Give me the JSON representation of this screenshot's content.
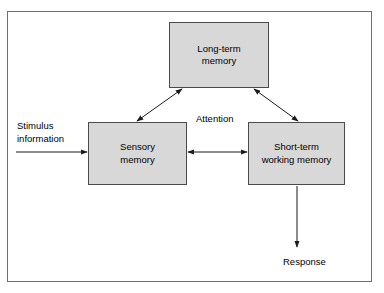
{
  "diagram": {
    "frame": {
      "border_color": "#6f6f72",
      "background": "#ffffff"
    },
    "node_style": {
      "fill": "#d8d8d8",
      "border_color": "#4a4a4d",
      "text_color": "#000000"
    },
    "nodes": [
      {
        "id": "long-term-memory",
        "label": "Long-term\nmemory"
      },
      {
        "id": "sensory-memory",
        "label": "Sensory\nmemory"
      },
      {
        "id": "short-term-working-memory",
        "label": "Short-term\nworking memory"
      }
    ],
    "labels": [
      {
        "id": "stimulus-information",
        "text": "Stimulus\ninformation"
      },
      {
        "id": "attention",
        "text": "Attention"
      },
      {
        "id": "response",
        "text": "Response"
      }
    ],
    "connectors": [
      {
        "id": "stimulus-to-sensory",
        "from": "stimulus-information",
        "to": "sensory-memory",
        "arrowheads": "end"
      },
      {
        "id": "sensory-to-longterm",
        "from": "sensory-memory",
        "to": "long-term-memory",
        "arrowheads": "both"
      },
      {
        "id": "longterm-to-shortterm",
        "from": "long-term-memory",
        "to": "short-term-working-memory",
        "arrowheads": "both"
      },
      {
        "id": "sensory-to-shortterm",
        "from": "sensory-memory",
        "to": "short-term-working-memory",
        "arrowheads": "both"
      },
      {
        "id": "shortterm-to-response",
        "from": "short-term-working-memory",
        "to": "response",
        "arrowheads": "end"
      }
    ]
  }
}
